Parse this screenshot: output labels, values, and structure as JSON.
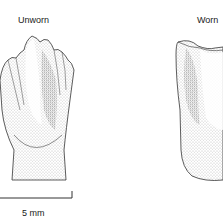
{
  "figure": {
    "panels": [
      {
        "label": "Unworn"
      },
      {
        "label": "Worn"
      }
    ],
    "scale_bar": {
      "label": "5 mm"
    }
  },
  "colors": {
    "ink": "#333333",
    "stipple": "#888888",
    "background": "#ffffff"
  }
}
